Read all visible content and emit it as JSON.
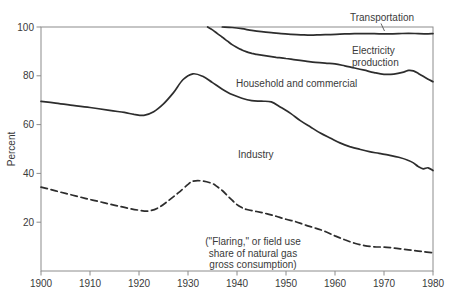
{
  "chart_data": {
    "type": "line",
    "title": "",
    "xlabel": "",
    "ylabel": "Percent",
    "xlim": [
      1900,
      1980
    ],
    "ylim": [
      0,
      100
    ],
    "x_ticks": [
      1900,
      1910,
      1920,
      1930,
      1940,
      1950,
      1960,
      1970,
      1980
    ],
    "y_ticks": [
      20,
      40,
      60,
      80,
      100
    ],
    "grid": "off",
    "legend_position": "inline-annotations",
    "colors": {
      "line": "#2d2d2d",
      "frame": "#8c8c8c",
      "text": "#3a3a3a",
      "background": "#ffffff"
    },
    "series": [
      {
        "id": "household-commercial",
        "name": "Household and commercial",
        "style": "solid",
        "points": [
          [
            1900,
            69.5
          ],
          [
            1903,
            68.8
          ],
          [
            1906,
            68.0
          ],
          [
            1910,
            67.0
          ],
          [
            1914,
            65.8
          ],
          [
            1917,
            65.0
          ],
          [
            1919,
            64.2
          ],
          [
            1921,
            63.8
          ],
          [
            1923,
            65.3
          ],
          [
            1925,
            68.5
          ],
          [
            1927,
            73.0
          ],
          [
            1929,
            78.5
          ],
          [
            1931,
            80.8
          ],
          [
            1933,
            79.8
          ],
          [
            1935,
            77.2
          ],
          [
            1937,
            74.5
          ],
          [
            1939,
            72.3
          ],
          [
            1941,
            70.8
          ],
          [
            1943,
            69.8
          ],
          [
            1945,
            69.6
          ],
          [
            1947,
            69.3
          ],
          [
            1949,
            67.0
          ],
          [
            1951,
            64.5
          ],
          [
            1953,
            61.5
          ],
          [
            1955,
            59.0
          ],
          [
            1957,
            56.5
          ],
          [
            1959,
            54.5
          ],
          [
            1961,
            52.5
          ],
          [
            1963,
            51.0
          ],
          [
            1965,
            49.9
          ],
          [
            1967,
            48.9
          ],
          [
            1969,
            48.2
          ],
          [
            1971,
            47.5
          ],
          [
            1973,
            46.6
          ],
          [
            1975,
            45.3
          ],
          [
            1976,
            44.3
          ],
          [
            1977,
            42.8
          ],
          [
            1978,
            41.9
          ],
          [
            1979,
            42.3
          ],
          [
            1980,
            41.2
          ]
        ]
      },
      {
        "id": "electricity-production",
        "name": "Electricity production",
        "style": "solid",
        "points": [
          [
            1934,
            100
          ],
          [
            1935,
            98.8
          ],
          [
            1936,
            97.3
          ],
          [
            1937,
            95.8
          ],
          [
            1938,
            94.3
          ],
          [
            1939,
            92.8
          ],
          [
            1940,
            91.6
          ],
          [
            1941,
            90.6
          ],
          [
            1942,
            89.8
          ],
          [
            1943,
            89.2
          ],
          [
            1944,
            88.8
          ],
          [
            1946,
            88.2
          ],
          [
            1948,
            87.6
          ],
          [
            1950,
            87.1
          ],
          [
            1952,
            86.5
          ],
          [
            1954,
            86.0
          ],
          [
            1956,
            85.5
          ],
          [
            1958,
            85.2
          ],
          [
            1960,
            84.9
          ],
          [
            1962,
            84.1
          ],
          [
            1964,
            83.2
          ],
          [
            1966,
            82.3
          ],
          [
            1968,
            81.3
          ],
          [
            1970,
            80.6
          ],
          [
            1972,
            80.7
          ],
          [
            1974,
            81.5
          ],
          [
            1975,
            82.2
          ],
          [
            1976,
            82.0
          ],
          [
            1977,
            81.0
          ],
          [
            1978,
            79.8
          ],
          [
            1979,
            78.6
          ],
          [
            1980,
            77.6
          ]
        ]
      },
      {
        "id": "transportation",
        "name": "Transportation",
        "style": "solid",
        "points": [
          [
            1937,
            100
          ],
          [
            1939,
            99.8
          ],
          [
            1941,
            99.3
          ],
          [
            1943,
            98.6
          ],
          [
            1945,
            98.1
          ],
          [
            1947,
            97.7
          ],
          [
            1949,
            97.3
          ],
          [
            1951,
            97.0
          ],
          [
            1953,
            96.8
          ],
          [
            1955,
            96.7
          ],
          [
            1957,
            96.8
          ],
          [
            1959,
            96.9
          ],
          [
            1961,
            97.1
          ],
          [
            1963,
            97.2
          ],
          [
            1965,
            97.3
          ],
          [
            1967,
            97.3
          ],
          [
            1969,
            97.2
          ],
          [
            1971,
            97.2
          ],
          [
            1973,
            97.3
          ],
          [
            1975,
            97.4
          ],
          [
            1977,
            97.3
          ],
          [
            1979,
            97.2
          ],
          [
            1980,
            97.3
          ]
        ]
      },
      {
        "id": "flaring",
        "name": "(\"Flaring,\" or field use share of natural gas gross consumption)",
        "style": "dashed",
        "points": [
          [
            1900,
            34.4
          ],
          [
            1902,
            33.4
          ],
          [
            1904,
            32.3
          ],
          [
            1906,
            31.3
          ],
          [
            1908,
            30.3
          ],
          [
            1910,
            29.3
          ],
          [
            1912,
            28.4
          ],
          [
            1914,
            27.4
          ],
          [
            1916,
            26.5
          ],
          [
            1918,
            25.6
          ],
          [
            1920,
            24.9
          ],
          [
            1922,
            24.6
          ],
          [
            1924,
            26.0
          ],
          [
            1926,
            28.8
          ],
          [
            1928,
            32.0
          ],
          [
            1930,
            35.5
          ],
          [
            1931,
            36.8
          ],
          [
            1933,
            36.9
          ],
          [
            1935,
            35.8
          ],
          [
            1936,
            34.5
          ],
          [
            1937,
            33.0
          ],
          [
            1938,
            31.0
          ],
          [
            1939,
            29.0
          ],
          [
            1940,
            27.2
          ],
          [
            1941,
            26.0
          ],
          [
            1942,
            25.2
          ],
          [
            1944,
            24.4
          ],
          [
            1946,
            23.5
          ],
          [
            1948,
            22.4
          ],
          [
            1950,
            21.2
          ],
          [
            1952,
            20.2
          ],
          [
            1954,
            18.8
          ],
          [
            1956,
            17.6
          ],
          [
            1958,
            16.2
          ],
          [
            1960,
            14.4
          ],
          [
            1962,
            12.8
          ],
          [
            1964,
            11.4
          ],
          [
            1966,
            10.4
          ],
          [
            1968,
            9.9
          ],
          [
            1970,
            9.8
          ],
          [
            1972,
            9.4
          ],
          [
            1974,
            8.9
          ],
          [
            1976,
            8.4
          ],
          [
            1978,
            7.9
          ],
          [
            1980,
            7.4
          ]
        ]
      }
    ],
    "annotations": [
      {
        "id": "transportation",
        "lines": [
          "Transportation"
        ],
        "x": 382,
        "y": 21,
        "align": "middle",
        "leader": [
          381,
          23.5,
          384.5,
          31
        ]
      },
      {
        "id": "electricity-production",
        "lines": [
          "Electricity",
          "production"
        ],
        "x": 352,
        "y": 54,
        "align": "start"
      },
      {
        "id": "household-commercial",
        "lines": [
          "Household and commercial"
        ],
        "x": 236,
        "y": 87,
        "align": "start"
      },
      {
        "id": "industry",
        "lines": [
          "Industry"
        ],
        "x": 238,
        "y": 158,
        "align": "start"
      },
      {
        "id": "flaring",
        "lines": [
          "(\"Flaring,\" or field use",
          "share of natural gas",
          "gross consumption)"
        ],
        "x": 253,
        "y": 245,
        "align": "middle"
      }
    ]
  }
}
